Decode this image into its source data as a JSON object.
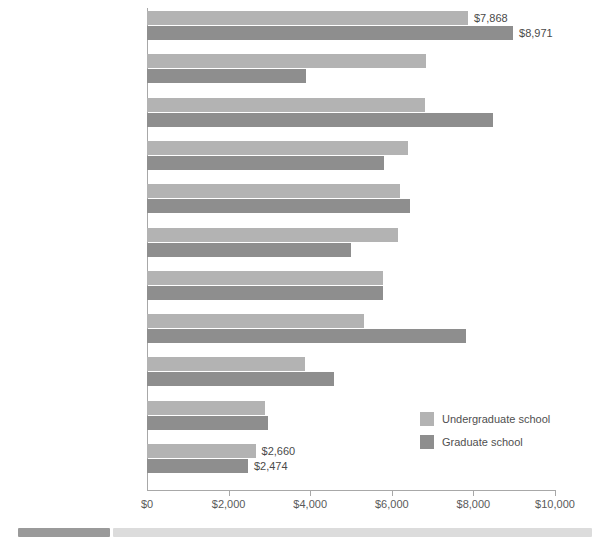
{
  "chart_data": {
    "type": "bar",
    "orientation": "horizontal",
    "title": "",
    "xlabel": "",
    "ylabel": "",
    "xlim": [
      0,
      10000
    ],
    "grid": false,
    "legend_position": "inside-bottom-right",
    "categories": [
      "Ontario",
      "Saskatchewan",
      "Nova Scotia",
      "New Brunswick",
      "CANADA",
      "Prince Edward Island",
      "Alberta",
      "British Columbia",
      "Manitoba",
      "Quebec",
      "Newfoundland and Labrador"
    ],
    "series": [
      {
        "name": "Undergraduate school",
        "color": "#b3b3b3",
        "values": [
          7868,
          6840,
          6815,
          6400,
          6200,
          6160,
          5780,
          5330,
          3880,
          2890,
          2660
        ]
      },
      {
        "name": "Graduate school",
        "color": "#8e8e8e",
        "values": [
          8971,
          3900,
          8480,
          5800,
          6450,
          4990,
          5780,
          7820,
          4590,
          2960,
          2474
        ]
      }
    ],
    "xticks": [
      0,
      2000,
      4000,
      6000,
      8000,
      10000
    ],
    "xtick_labels": [
      "$0",
      "$2,000",
      "$4,000",
      "$6,000",
      "$8,000",
      "$10,000"
    ],
    "data_labels": {
      "Ontario": {
        "Undergraduate school": "$7,868",
        "Graduate school": "$8,971"
      },
      "Newfoundland and Labrador": {
        "Undergraduate school": "$2,660",
        "Graduate school": "$2,474"
      }
    }
  },
  "legend": {
    "items": [
      {
        "label": "Undergraduate school",
        "color": "#b3b3b3"
      },
      {
        "label": "Graduate school",
        "color": "#8e8e8e"
      }
    ]
  },
  "scrollbar": {
    "orientation": "horizontal",
    "thumb_position": "left"
  }
}
